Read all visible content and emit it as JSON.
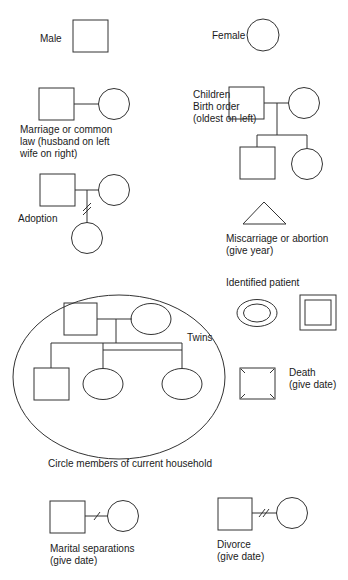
{
  "diagram": {
    "type": "genogram-legend",
    "line_color": "#333333",
    "text_color": "#1a1a1a",
    "background": "#ffffff"
  },
  "symbols": {
    "male": {
      "label": "Male"
    },
    "female": {
      "label": "Female"
    },
    "marriage": {
      "label_lines": [
        "Marriage or common",
        "law (husband on left",
        "wife on right)"
      ]
    },
    "children": {
      "label_lines": [
        "Children",
        "Birth order",
        "(oldest on left)"
      ]
    },
    "adoption": {
      "label": "Adoption"
    },
    "miscarriage": {
      "label_lines": [
        "Miscarriage or abortion",
        "(give year)"
      ]
    },
    "identified_patient": {
      "label": "Identified patient"
    },
    "twins": {
      "label": "Twins"
    },
    "household": {
      "label": "Circle members of current household"
    },
    "death": {
      "label_lines": [
        "Death",
        "(give date)"
      ]
    },
    "marital_separation": {
      "label_lines": [
        "Marital separations",
        "(give date)"
      ]
    },
    "divorce": {
      "label_lines": [
        "Divorce",
        "(give date)"
      ]
    }
  }
}
